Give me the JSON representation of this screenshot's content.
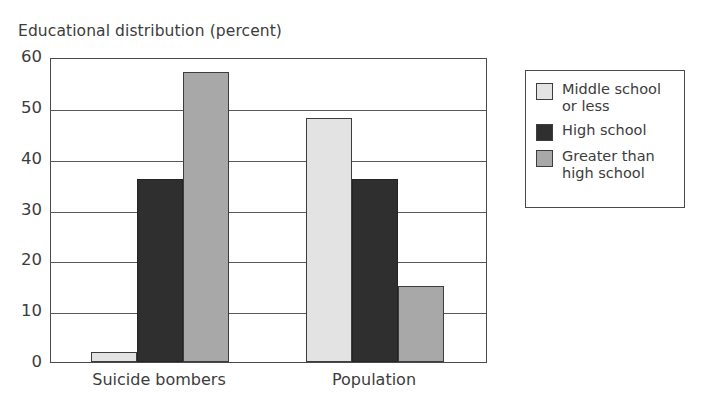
{
  "chart_data": {
    "type": "bar",
    "title": "Educational distribution (percent)",
    "xlabel": "",
    "ylabel": "",
    "categories": [
      "Suicide bombers",
      "Population"
    ],
    "series": [
      {
        "name": "Middle school or less",
        "color": "#e3e3e3",
        "values": [
          2,
          48
        ]
      },
      {
        "name": "High school",
        "color": "#2f2f2f",
        "values": [
          36,
          36
        ]
      },
      {
        "name": "Greater than high school",
        "color": "#a8a8a8",
        "values": [
          57,
          15
        ]
      }
    ],
    "ylim": [
      0,
      60
    ],
    "yticks": [
      0,
      10,
      20,
      30,
      40,
      50,
      60
    ],
    "ytick_labels": [
      "0",
      "10",
      "20",
      "30",
      "40",
      "50",
      "60"
    ],
    "grid": true,
    "legend_position": "right"
  },
  "legend": {
    "entries": [
      {
        "label": "Middle school or less",
        "swatch": "swatch-light"
      },
      {
        "label": "High school",
        "swatch": "swatch-dark"
      },
      {
        "label": "Greater than high school",
        "swatch": "swatch-medium"
      }
    ]
  }
}
